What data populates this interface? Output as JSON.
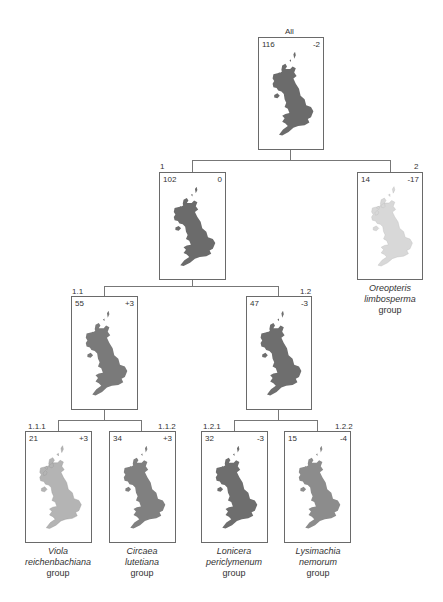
{
  "diagram": {
    "type": "hierarchical-tree",
    "nodes": [
      {
        "id": "All",
        "count": "116",
        "delta": "-2",
        "shade": "#6b6b6b",
        "caption": null
      },
      {
        "id": "1",
        "count": "102",
        "delta": "0",
        "shade": "#6b6b6b",
        "caption": null
      },
      {
        "id": "2",
        "count": "14",
        "delta": "-17",
        "shade": "#d8d8d8",
        "caption": {
          "genus": "Oreopteris",
          "species": "limbosperma",
          "suffix": "group"
        }
      },
      {
        "id": "1.1",
        "count": "55",
        "delta": "+3",
        "shade": "#7a7a7a",
        "caption": null
      },
      {
        "id": "1.2",
        "count": "47",
        "delta": "-3",
        "shade": "#6e6e6e",
        "caption": null
      },
      {
        "id": "1.1.1",
        "count": "21",
        "delta": "+3",
        "shade": "#b4b4b4",
        "caption": {
          "genus": "Viola",
          "species": "reichenbachiana",
          "suffix": "group"
        }
      },
      {
        "id": "1.1.2",
        "count": "34",
        "delta": "+3",
        "shade": "#808080",
        "caption": {
          "genus": "Circaea",
          "species": "lutetiana",
          "suffix": "group"
        }
      },
      {
        "id": "1.2.1",
        "count": "32",
        "delta": "-3",
        "shade": "#6e6e6e",
        "caption": {
          "genus": "Lonicera",
          "species": "periclymenum",
          "suffix": "group"
        }
      },
      {
        "id": "1.2.2",
        "count": "15",
        "delta": "-4",
        "shade": "#8c8c8c",
        "caption": {
          "genus": "Lysimachia",
          "species": "nemorum",
          "suffix": "group"
        }
      }
    ],
    "edges": [
      [
        "All",
        "1"
      ],
      [
        "All",
        "2"
      ],
      [
        "1",
        "1.1"
      ],
      [
        "1",
        "1.2"
      ],
      [
        "1.1",
        "1.1.1"
      ],
      [
        "1.1",
        "1.1.2"
      ],
      [
        "1.2",
        "1.2.1"
      ],
      [
        "1.2",
        "1.2.2"
      ]
    ]
  },
  "labels": {
    "all": {
      "id": "All",
      "count": "116",
      "delta": "-2"
    },
    "n1": {
      "id": "1",
      "count": "102",
      "delta": "0"
    },
    "n2": {
      "id": "2",
      "count": "14",
      "delta": "-17",
      "genus": "Oreopteris",
      "species": "limbosperma",
      "suffix": "group"
    },
    "n11": {
      "id": "1.1",
      "count": "55",
      "delta": "+3"
    },
    "n12": {
      "id": "1.2",
      "count": "47",
      "delta": "-3"
    },
    "n111": {
      "id": "1.1.1",
      "count": "21",
      "delta": "+3",
      "genus": "Viola",
      "species": "reichenbachiana",
      "suffix": "group"
    },
    "n112": {
      "id": "1.1.2",
      "count": "34",
      "delta": "+3",
      "genus": "Circaea",
      "species": "lutetiana",
      "suffix": "group"
    },
    "n121": {
      "id": "1.2.1",
      "count": "32",
      "delta": "-3",
      "genus": "Lonicera",
      "species": "periclymenum",
      "suffix": "group"
    },
    "n122": {
      "id": "1.2.2",
      "count": "15",
      "delta": "-4",
      "genus": "Lysimachia",
      "species": "nemorum",
      "suffix": "group"
    }
  },
  "colors": {
    "line": "#777777",
    "border": "#6a6a6a",
    "map_dark": "#6b6b6b",
    "map_light": "#d8d8d8"
  }
}
